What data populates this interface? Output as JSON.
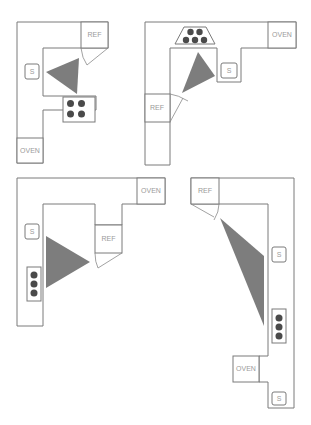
{
  "header": {
    "fragment": ""
  },
  "colors": {
    "outline": "#7a7a7a",
    "triangle": "#7d7d7d",
    "burner": "#4a4a4a",
    "label": "#9a9a9a",
    "background": "#ffffff"
  },
  "layouts": [
    {
      "id": "layout-1",
      "position": "top-left",
      "shape": "U-shaped",
      "labels": {
        "refrigerator": "REF",
        "sink": "S",
        "oven": "OVEN"
      },
      "cooktop_burners": 4
    },
    {
      "id": "layout-2",
      "position": "top-right",
      "shape": "L-shaped",
      "labels": {
        "refrigerator": "REF",
        "sink": "S",
        "oven": "OVEN"
      },
      "cooktop_burners": 5
    },
    {
      "id": "layout-3",
      "position": "bottom-left",
      "shape": "L-shaped",
      "labels": {
        "refrigerator": "REF",
        "sink": "S",
        "oven": "OVEN"
      },
      "cooktop_burners": 3
    },
    {
      "id": "layout-4",
      "position": "bottom-right",
      "shape": "galley",
      "labels": {
        "refrigerator": "REF",
        "sink": "S",
        "sink_2": "S",
        "oven": "OVEN"
      },
      "cooktop_burners": 3
    }
  ]
}
